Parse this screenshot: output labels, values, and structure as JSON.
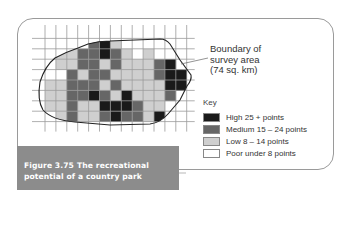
{
  "figure": {
    "number": "Figure 3.75",
    "title_line1": "The recreational",
    "title_line2": "potential of a country park",
    "caption_bg": "#8c8c8c"
  },
  "annotation": {
    "line1": "Boundary of",
    "line2": "survey area",
    "line3": "(74 sq. km)"
  },
  "key": {
    "title": "Key",
    "items": [
      {
        "label": "High 25 + points",
        "color": "#1a1a1a"
      },
      {
        "label": "Medium 15 – 24 points",
        "color": "#666666"
      },
      {
        "label": "Low 8 – 14 points",
        "color": "#cfcfcf"
      },
      {
        "label": "Poor under 8 points",
        "color": "#ffffff"
      }
    ]
  },
  "grid": {
    "origin_x": 45,
    "origin_y": 28,
    "cell_w": 10.9,
    "cell_h": 10.4,
    "cols": 13,
    "rows": 9,
    "levels_legend": "0=poor,1=low,2=medium,3=high",
    "cells": [
      [
        0,
        0,
        0,
        0,
        0,
        0,
        0,
        0,
        0,
        0,
        0,
        0,
        0
      ],
      [
        0,
        0,
        0,
        0,
        2,
        3,
        1,
        0,
        0,
        0,
        0,
        0,
        0
      ],
      [
        0,
        1,
        1,
        2,
        2,
        3,
        2,
        1,
        0,
        1,
        0,
        0,
        0
      ],
      [
        0,
        1,
        1,
        2,
        2,
        1,
        2,
        1,
        1,
        1,
        2,
        3,
        0
      ],
      [
        0,
        0,
        2,
        1,
        2,
        2,
        1,
        1,
        1,
        1,
        2,
        3,
        3
      ],
      [
        1,
        1,
        2,
        2,
        2,
        1,
        2,
        1,
        1,
        1,
        1,
        3,
        3
      ],
      [
        1,
        1,
        2,
        2,
        3,
        2,
        1,
        3,
        1,
        1,
        1,
        2,
        0
      ],
      [
        1,
        1,
        2,
        1,
        1,
        3,
        3,
        3,
        2,
        1,
        1,
        0,
        0
      ],
      [
        0,
        1,
        2,
        1,
        1,
        2,
        3,
        2,
        2,
        1,
        3,
        0,
        0
      ]
    ]
  }
}
